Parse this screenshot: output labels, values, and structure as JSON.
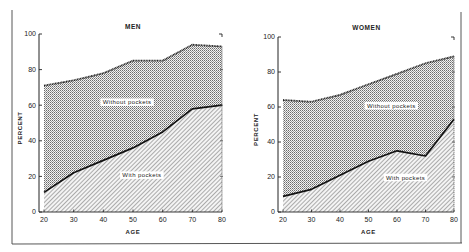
{
  "figure": {
    "frame_color": "#333333",
    "ink_color": "#111111",
    "label_bg": "#ffffff"
  },
  "chart_data": [
    {
      "type": "area",
      "title": "MEN",
      "xlabel": "AGE",
      "ylabel": "PERCENT",
      "x": [
        20,
        30,
        40,
        50,
        60,
        70,
        80
      ],
      "xticks": [
        "20",
        "30",
        "40",
        "50",
        "60",
        "70",
        "80"
      ],
      "yticks": [
        "0",
        "20",
        "40",
        "60",
        "80",
        "100"
      ],
      "xlim": [
        20,
        80
      ],
      "ylim": [
        0,
        100
      ],
      "grid": false,
      "series": [
        {
          "name": "With pockets",
          "values": [
            11,
            22,
            29,
            36,
            45,
            58,
            60
          ]
        },
        {
          "name": "Without pockets",
          "values": [
            71,
            74,
            78,
            85,
            85,
            94,
            93
          ]
        }
      ],
      "annotations": [
        {
          "text": "Without pockets",
          "x": 48,
          "y": 61
        },
        {
          "text": "With pockets",
          "x": 53,
          "y": 20
        }
      ]
    },
    {
      "type": "area",
      "title": "WOMEN",
      "xlabel": "AGE",
      "ylabel": "PERCENT",
      "x": [
        20,
        30,
        40,
        50,
        60,
        70,
        80
      ],
      "xticks": [
        "20",
        "30",
        "40",
        "50",
        "60",
        "70",
        "80"
      ],
      "yticks": [
        "0",
        "20",
        "40",
        "60",
        "80",
        "100"
      ],
      "xlim": [
        20,
        80
      ],
      "ylim": [
        0,
        100
      ],
      "grid": false,
      "series": [
        {
          "name": "With pockets",
          "values": [
            9,
            13,
            21,
            29,
            35,
            32,
            53
          ]
        },
        {
          "name": "Without pockets",
          "values": [
            64,
            63,
            67,
            73,
            79,
            85,
            89
          ]
        }
      ],
      "annotations": [
        {
          "text": "Without pockets",
          "x": 58,
          "y": 60
        },
        {
          "text": "With pockets",
          "x": 63,
          "y": 19
        }
      ]
    }
  ]
}
